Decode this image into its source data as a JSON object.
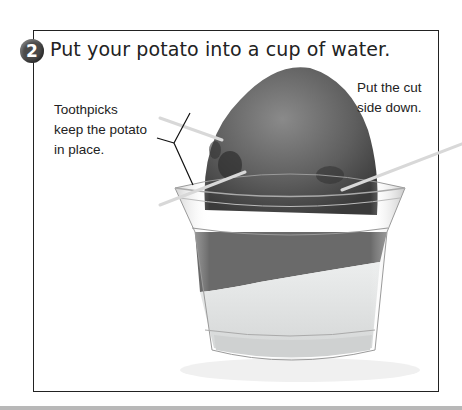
{
  "step": {
    "number": "2",
    "title": "Put your potato into a cup of water."
  },
  "callouts": {
    "toothpicks": [
      "Toothpicks",
      "keep the potato",
      "in place."
    ],
    "cut_side": [
      "Put the cut",
      "side down."
    ]
  },
  "image": {
    "description": "potato-in-cup-of-water-with-toothpicks",
    "colors": {
      "potato": "#5a5a5a",
      "water": "#e4e6e6",
      "frame": "#222222"
    }
  }
}
